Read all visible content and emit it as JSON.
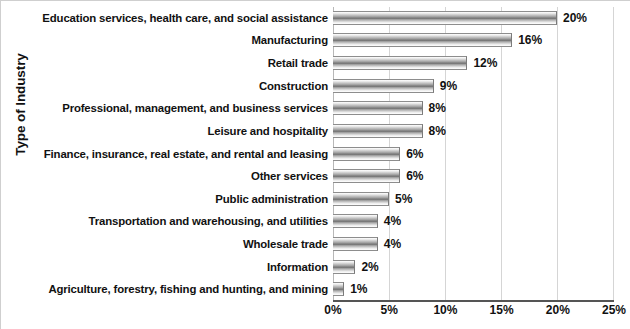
{
  "chart_data": {
    "type": "bar",
    "orientation": "horizontal",
    "title": "",
    "xlabel": "",
    "ylabel": "Type of Industry",
    "xlim": [
      0,
      25
    ],
    "xticks": [
      "0%",
      "5%",
      "10%",
      "15%",
      "20%",
      "25%"
    ],
    "xtick_values": [
      0,
      5,
      10,
      15,
      20,
      25
    ],
    "grid": true,
    "legend": false,
    "categories": [
      "Education services, health care, and social assistance",
      "Manufacturing",
      "Retail trade",
      "Construction",
      "Professional, management, and business services",
      "Leisure and hospitality",
      "Finance, insurance, real estate, and rental and leasing",
      "Other services",
      "Public administration",
      "Transportation and warehousing, and utilities",
      "Wholesale trade",
      "Information",
      "Agriculture, forestry, fishing and hunting, and mining"
    ],
    "values": [
      20,
      16,
      12,
      9,
      8,
      8,
      6,
      6,
      5,
      4,
      4,
      2,
      1
    ],
    "data_labels": [
      "20%",
      "16%",
      "12%",
      "9%",
      "8%",
      "8%",
      "6%",
      "6%",
      "5%",
      "4%",
      "4%",
      "2%",
      "1%"
    ]
  },
  "colors": {
    "bar_dark": "#6f6f6f",
    "bar_light": "#ffffff",
    "gridline": "#d5d5d5",
    "axis": "#555555",
    "text": "#111111",
    "background": "#ffffff"
  }
}
